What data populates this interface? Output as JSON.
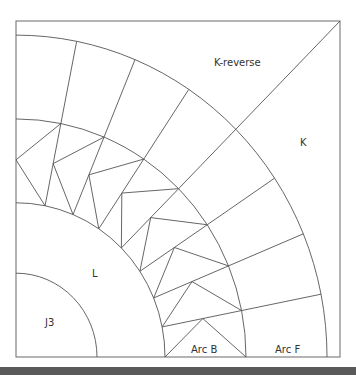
{
  "diagram": {
    "colors": {
      "line": "#555555",
      "frame": "#777777",
      "text": "#333333",
      "bar": "#5a5a5a"
    },
    "frame": {
      "left": 16,
      "top": 21,
      "right": 340,
      "bottom": 357
    },
    "center": {
      "x": 16,
      "y": 357
    },
    "y_scale": 1.035,
    "arcs": {
      "J3": 81,
      "L": 149,
      "arc_b": 230,
      "arc_f": 311
    },
    "sector_step_deg": 11.25,
    "sector_count": 8,
    "labels": {
      "k_reverse": "K-reverse",
      "k": "K",
      "l": "L",
      "j3": "J3",
      "arc_b": "Arc B",
      "arc_f": "Arc F"
    }
  }
}
